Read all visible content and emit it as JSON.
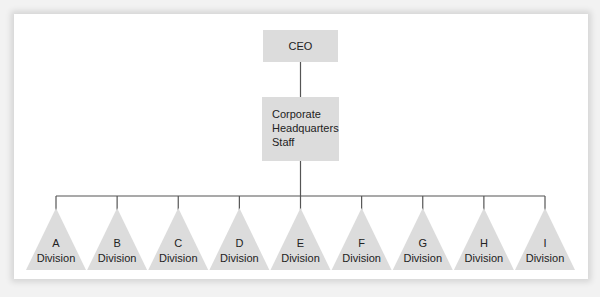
{
  "diagram": {
    "type": "organizational-chart",
    "colors": {
      "box_fill": "#dcdcdc",
      "line": "#555555",
      "panel": "#ffffff",
      "background": "#f2f2f2",
      "text": "#222222"
    },
    "top": {
      "label": "CEO"
    },
    "staff": {
      "lines": [
        "Corporate",
        "Headquarters",
        "Staff"
      ]
    },
    "divisions": [
      {
        "letter": "A",
        "label": "Division"
      },
      {
        "letter": "B",
        "label": "Division"
      },
      {
        "letter": "C",
        "label": "Division"
      },
      {
        "letter": "D",
        "label": "Division"
      },
      {
        "letter": "E",
        "label": "Division"
      },
      {
        "letter": "F",
        "label": "Division"
      },
      {
        "letter": "G",
        "label": "Division"
      },
      {
        "letter": "H",
        "label": "Division"
      },
      {
        "letter": "I",
        "label": "Division"
      }
    ]
  }
}
